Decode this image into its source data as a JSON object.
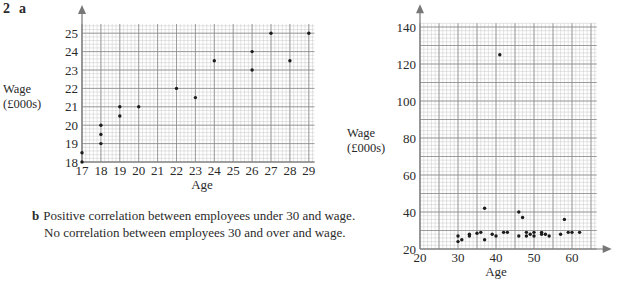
{
  "question": {
    "number": "2",
    "part_a": "a",
    "part_b": "b"
  },
  "answer_b": {
    "line1": "Positive correlation between employees under 30 and wage.",
    "line2": "No correlation between employees 30 and over and wage."
  },
  "colors": {
    "grid_minor": "#c9c9c9",
    "grid_major": "#8a8a8a",
    "axis": "#777777",
    "point": "#1a1a1a",
    "text": "#2a2a2a"
  },
  "chart_data": [
    {
      "type": "scatter",
      "title": "",
      "xlabel": "Age",
      "ylabel": "Wage (£000s)",
      "ylabel_line1": "Wage",
      "ylabel_line2": "(£000s)",
      "xlim": [
        17,
        29.3
      ],
      "ylim": [
        18,
        25.5
      ],
      "xticks": [
        17,
        18,
        19,
        20,
        21,
        22,
        23,
        24,
        25,
        26,
        27,
        28,
        29
      ],
      "yticks": [
        18,
        19,
        20,
        21,
        22,
        23,
        24,
        25
      ],
      "grid": true,
      "points": [
        [
          17,
          18
        ],
        [
          17,
          18.5
        ],
        [
          18,
          19
        ],
        [
          18,
          19.5
        ],
        [
          18,
          20
        ],
        [
          19,
          20.5
        ],
        [
          19,
          21
        ],
        [
          20,
          21
        ],
        [
          22,
          22
        ],
        [
          23,
          21.5
        ],
        [
          24,
          23.5
        ],
        [
          26,
          23
        ],
        [
          26,
          24
        ],
        [
          27,
          25
        ],
        [
          28,
          23.5
        ],
        [
          29,
          25
        ]
      ]
    },
    {
      "type": "scatter",
      "title": "",
      "xlabel": "Age",
      "ylabel": "Wage (£000s)",
      "ylabel_line1": "Wage",
      "ylabel_line2": "(£000s)",
      "xlim": [
        20,
        66.5
      ],
      "ylim": [
        20,
        142
      ],
      "xticks": [
        20,
        30,
        40,
        50,
        60
      ],
      "yticks": [
        20,
        40,
        60,
        80,
        100,
        120,
        140
      ],
      "grid": true,
      "points": [
        [
          30,
          27
        ],
        [
          30,
          24
        ],
        [
          31,
          25
        ],
        [
          33,
          28
        ],
        [
          33,
          27
        ],
        [
          35,
          28.5
        ],
        [
          36,
          29
        ],
        [
          37,
          42
        ],
        [
          37,
          25
        ],
        [
          39,
          28
        ],
        [
          40,
          27
        ],
        [
          41,
          125
        ],
        [
          42,
          29
        ],
        [
          43,
          29
        ],
        [
          46,
          40
        ],
        [
          47,
          37
        ],
        [
          46,
          27
        ],
        [
          48,
          29
        ],
        [
          48,
          27
        ],
        [
          49,
          28
        ],
        [
          50,
          29
        ],
        [
          50,
          27
        ],
        [
          52,
          29
        ],
        [
          52,
          28
        ],
        [
          53,
          28
        ],
        [
          54,
          27
        ],
        [
          57,
          28
        ],
        [
          58,
          36
        ],
        [
          59,
          29
        ],
        [
          60,
          29
        ],
        [
          62,
          29
        ]
      ]
    }
  ]
}
